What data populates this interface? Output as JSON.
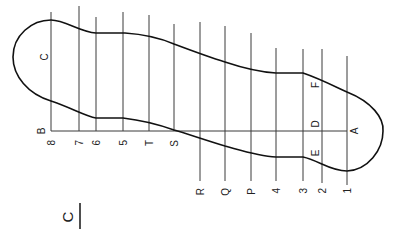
{
  "figure": {
    "title_letter": "C",
    "inner_label": "C",
    "centerline": {
      "y": 131,
      "x_start": 51,
      "x_end": 347
    },
    "stations": [
      {
        "x": 51,
        "top": 12,
        "bottom": 131,
        "label": "8",
        "label_x": 51,
        "label_y": 140
      },
      {
        "x": 79,
        "top": 6,
        "bottom": 131,
        "label": "7",
        "label_x": 79,
        "label_y": 140
      },
      {
        "x": 96,
        "top": 17,
        "bottom": 131,
        "label": "6",
        "label_x": 96,
        "label_y": 140
      },
      {
        "x": 123,
        "top": 12,
        "bottom": 131,
        "label": "5",
        "label_x": 123,
        "label_y": 140
      },
      {
        "x": 149,
        "top": 15,
        "bottom": 131,
        "label": "T",
        "label_x": 149,
        "label_y": 140
      },
      {
        "x": 174,
        "top": 24,
        "bottom": 131,
        "label": "S",
        "label_x": 174,
        "label_y": 140
      },
      {
        "x": 200,
        "top": 22,
        "bottom": 181,
        "label": "R",
        "label_x": 200,
        "label_y": 188
      },
      {
        "x": 225,
        "top": 26,
        "bottom": 181,
        "label": "Q",
        "label_x": 225,
        "label_y": 188
      },
      {
        "x": 251,
        "top": 33,
        "bottom": 181,
        "label": "P",
        "label_x": 251,
        "label_y": 188
      },
      {
        "x": 276,
        "top": 48,
        "bottom": 181,
        "label": "4",
        "label_x": 276,
        "label_y": 188
      },
      {
        "x": 303,
        "top": 49,
        "bottom": 181,
        "label": "3",
        "label_x": 303,
        "label_y": 188
      },
      {
        "x": 322,
        "top": 49,
        "bottom": 183,
        "label": "2",
        "label_x": 322,
        "label_y": 188
      },
      {
        "x": 347,
        "top": 56,
        "bottom": 185,
        "label": "1",
        "label_x": 347,
        "label_y": 188
      }
    ],
    "point_labels": [
      {
        "text": "B",
        "x": 41,
        "y": 131
      },
      {
        "text": "A",
        "x": 354,
        "y": 131
      },
      {
        "text": "D",
        "x": 315,
        "y": 124
      },
      {
        "text": "E",
        "x": 315,
        "y": 153
      },
      {
        "text": "F",
        "x": 315,
        "y": 85
      },
      {
        "text": "C",
        "x": 44,
        "y": 57
      }
    ],
    "outline_path": "M 96 33 L 125 33 C 140 34, 160 38, 174 44 C 190 50, 212 58, 225 62 C 240 67, 258 72, 276 73 L 303 73 C 318 78, 334 86, 347 92 C 372 102, 384 118, 383 131 C 383 150, 368 170, 347 171 C 330 171, 318 160, 303 157 L 276 157 C 258 156, 240 150, 225 146 C 205 140, 185 133, 174 130 C 160 125, 140 120, 123 118 L 96 118 C 85 116, 72 108, 51 101 C 28 94, 13 76, 13 57 C 13 35, 32 20, 51 20 C 65 20, 80 32, 96 33 Z"
  }
}
